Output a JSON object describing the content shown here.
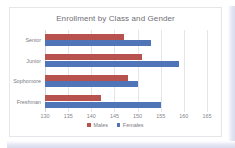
{
  "chart_data": {
    "type": "bar",
    "orientation": "horizontal",
    "title": "Enrollment by Class and Gender",
    "xlabel": "",
    "ylabel": "",
    "categories": [
      "Senior",
      "Junior",
      "Sophomore",
      "Freshman"
    ],
    "series": [
      {
        "name": "Males",
        "color": "#b8524e",
        "values": [
          147,
          151,
          148,
          142
        ]
      },
      {
        "name": "Females",
        "color": "#4f74b8",
        "values": [
          153,
          159,
          150,
          155
        ]
      }
    ],
    "xlim": [
      130,
      165
    ],
    "xticks": [
      130,
      135,
      140,
      145,
      150,
      155,
      160,
      165
    ],
    "xtick_labels": [
      "130",
      "135",
      "140",
      "145",
      "150",
      "155",
      "160",
      "165"
    ],
    "grid": "vertical",
    "legend_position": "bottom"
  },
  "colors": {
    "males": "#b8524e",
    "females": "#4f74b8",
    "gridline": "#e4e6ea",
    "title_text": "#6f6f76",
    "axis_text": "#85858c",
    "card_border": "#e6e6e8",
    "page_edge": "#dcdfee"
  }
}
